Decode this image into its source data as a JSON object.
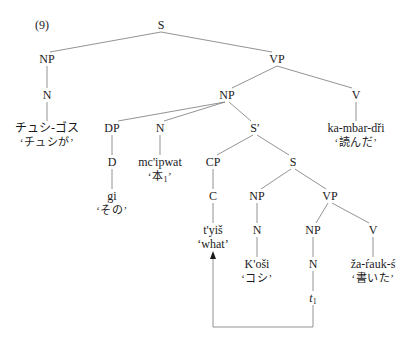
{
  "example_number": "(9)",
  "nodes": {
    "s_root": "S",
    "np_subj": "NP",
    "vp_main": "VP",
    "n_subj": "N",
    "np_obj": "NP",
    "v_main": "V",
    "subj_word": "チュシ-ゴス",
    "subj_gloss": "‘チュシが’",
    "dp": "DP",
    "n_obj": "N",
    "s_bar": "S′",
    "v_main_word": "ka-mbar-dři",
    "v_main_gloss": "‘読んだ’",
    "d": "D",
    "obj_word": "mc'ipwat",
    "obj_gloss_text": "‘本",
    "obj_gloss_sub": "1",
    "obj_gloss_close": "’",
    "cp": "CP",
    "s_emb": "S",
    "d_word": "gi",
    "d_gloss": "‘その’",
    "c": "C",
    "np_emb_subj": "NP",
    "vp_emb": "VP",
    "c_word": "t'yiš",
    "c_gloss": "‘what’",
    "n_emb_subj": "N",
    "np_emb_obj": "NP",
    "v_emb": "V",
    "emb_subj_word": "K'oši",
    "emb_subj_gloss": "‘コシ’",
    "n_emb_obj": "N",
    "v_emb_word": "ža-ŕauk-ś",
    "v_emb_gloss": "‘書いた’",
    "trace": "t",
    "trace_sub": "1"
  },
  "colors": {
    "line": "#777777",
    "text": "#1a1a1a"
  }
}
